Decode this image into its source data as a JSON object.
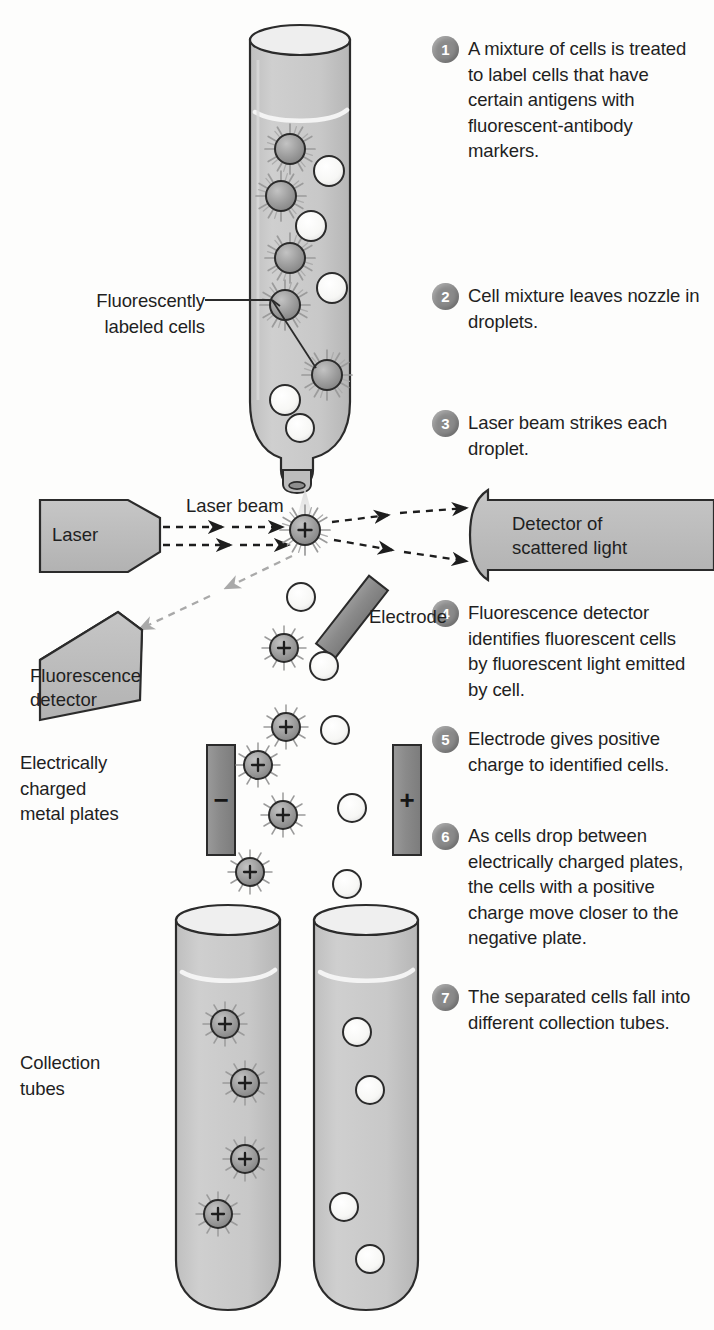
{
  "diagram": {
    "colors": {
      "tube_fill": "#c9c9c9",
      "device_fill": "#bdbdbd",
      "plate_fill": "#8d8d8d",
      "electrode_fill": "#8d8d8d",
      "fluorescent_cell": "#9a9a9a",
      "plain_cell": "#fbfbfb",
      "badge": "#8a8a8a",
      "outline": "#2b2b2b",
      "text": "#1f1f1f"
    }
  },
  "steps": [
    {
      "number": "1",
      "text": "A mixture of cells is treated to label cells that have certain antigens with fluorescent-antibody markers."
    },
    {
      "number": "2",
      "text": "Cell mixture leaves nozzle in droplets."
    },
    {
      "number": "3",
      "text": "Laser beam strikes each droplet."
    },
    {
      "number": "4",
      "text": "Fluorescence detector identifies fluorescent cells by fluorescent light emitted by cell."
    },
    {
      "number": "5",
      "text": "Electrode gives positive charge to identified cells."
    },
    {
      "number": "6",
      "text": "As cells drop between electrically charged plates, the cells with a positive charge move closer to the negative plate."
    },
    {
      "number": "7",
      "text": "The separated cells fall into different collection tubes."
    }
  ],
  "labels": {
    "fluorescently_labeled_cells": "Fluorescently\nlabeled cells",
    "fluorescently_labeled_cells_line1": "Fluorescently",
    "fluorescently_labeled_cells_line2": "labeled cells",
    "laser": "Laser",
    "laser_beam": "Laser beam",
    "detector_scattered_line1": "Detector of",
    "detector_scattered_line2": "scattered light",
    "fluorescence_detector_line1": "Fluorescence",
    "fluorescence_detector_line2": "detector",
    "electrode": "Electrode",
    "plates_line1": "Electrically",
    "plates_line2": "charged",
    "plates_line3": "metal plates",
    "collection_tubes_line1": "Collection",
    "collection_tubes_line2": "tubes",
    "plate_negative_sign": "−",
    "plate_positive_sign": "+",
    "charge_sign": "+"
  },
  "source_tube": {
    "fluorescent_cells": [
      {
        "cx": 290,
        "cy": 149
      },
      {
        "cx": 281,
        "cy": 196
      },
      {
        "cx": 290,
        "cy": 258
      },
      {
        "cx": 285,
        "cy": 305
      },
      {
        "cx": 327,
        "cy": 375
      }
    ],
    "plain_cells": [
      {
        "cx": 329,
        "cy": 171
      },
      {
        "cx": 311,
        "cy": 226
      },
      {
        "cx": 332,
        "cy": 288
      },
      {
        "cx": 285,
        "cy": 400
      },
      {
        "cx": 300,
        "cy": 428
      }
    ]
  },
  "stream": {
    "laser_hit_cell": {
      "cx": 305,
      "cy": 530,
      "charged": true
    },
    "charged_cells": [
      {
        "cx": 284,
        "cy": 648
      },
      {
        "cx": 286,
        "cy": 727
      },
      {
        "cx": 258,
        "cy": 765
      },
      {
        "cx": 283,
        "cy": 815
      },
      {
        "cx": 250,
        "cy": 872
      }
    ],
    "plain_cells": [
      {
        "cx": 301,
        "cy": 597
      },
      {
        "cx": 324,
        "cy": 666
      },
      {
        "cx": 335,
        "cy": 730
      },
      {
        "cx": 352,
        "cy": 808
      },
      {
        "cx": 347,
        "cy": 884
      }
    ]
  },
  "collection_tubes": {
    "left": {
      "name": "charged-cell-tube",
      "cells": [
        {
          "cx": 225,
          "cy": 1024
        },
        {
          "cx": 245,
          "cy": 1083
        },
        {
          "cx": 245,
          "cy": 1159
        },
        {
          "cx": 218,
          "cy": 1214
        }
      ]
    },
    "right": {
      "name": "plain-cell-tube",
      "cells": [
        {
          "cx": 357,
          "cy": 1032
        },
        {
          "cx": 370,
          "cy": 1090
        },
        {
          "cx": 344,
          "cy": 1207
        },
        {
          "cx": 370,
          "cy": 1259
        }
      ]
    }
  }
}
